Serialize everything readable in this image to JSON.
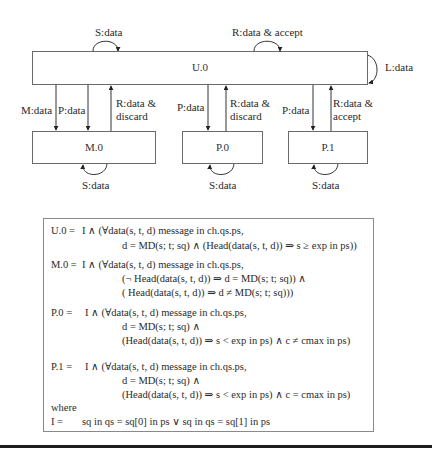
{
  "states": {
    "u0": "U.0",
    "m0": "M.0",
    "p0": "P.0",
    "p1": "P.1"
  },
  "transitions": {
    "u0_self_s": "S:data",
    "u0_self_r": "R:data & accept",
    "u0_self_l": "L:data",
    "u0_to_m0_m": "M:data",
    "u0_to_m0_p": "P:data",
    "m0_to_u0_r": [
      "R:data &",
      "discard"
    ],
    "u0_to_p0_p": "P:data",
    "p0_to_u0_r": [
      "R:data &",
      "discard"
    ],
    "u0_to_p1_p": "P:data",
    "p1_to_u0_r": [
      "R:data &",
      "accept"
    ],
    "m0_self_s": "S:data",
    "p0_self_s": "S:data",
    "p1_self_s": "S:data"
  },
  "formulas": {
    "u0": {
      "lhs": "U.0 =",
      "lines": [
        "I  ∧  (∀data(s, t, d) message in ch.qs.ps,",
        "d = MD(s; t; sq)  ∧  (Head(data(s, t, d)) ⇒ s ≥ exp in ps))"
      ]
    },
    "m0": {
      "lhs": "M.0 =",
      "lines": [
        "I  ∧  (∀data(s, t, d) message in ch.qs.ps,",
        "(¬ Head(data(s, t, d)) ⇒ d = MD(s; t; sq))  ∧",
        "(    Head(data(s, t, d)) ⇒ d ≠ MD(s; t; sq)))"
      ]
    },
    "p0": {
      "lhs": "P.0 =",
      "lines": [
        "I  ∧  (∀data(s, t, d) message in ch.qs.ps,",
        "d = MD(s; t; sq)  ∧",
        "(Head(data(s, t, d)) ⇒ s < exp in ps)  ∧  c ≠ cmax in ps)"
      ]
    },
    "p1": {
      "lhs": "P.1 =",
      "lines": [
        "I  ∧  (∀data(s, t, d) message in ch.qs.ps,",
        "d = MD(s; t; sq)  ∧",
        "(Head(data(s, t, d)) ⇒ s < exp in ps)  ∧  c = cmax in ps)"
      ]
    },
    "where": "where",
    "invariant": {
      "lhs": "I =",
      "rhs": "sq in qs = sq[0] in ps  ∨  sq in qs = sq[1] in ps"
    }
  }
}
